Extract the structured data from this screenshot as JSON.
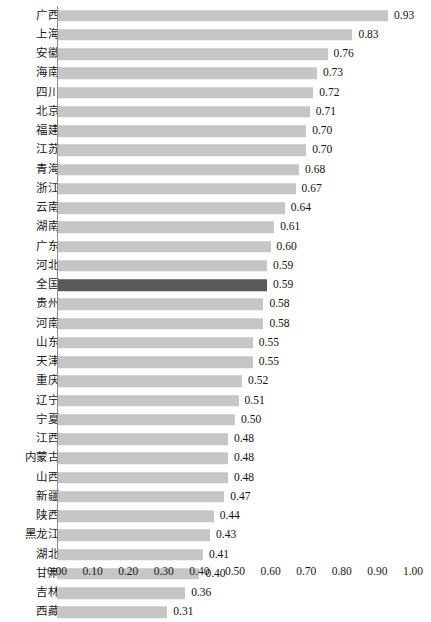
{
  "chart_data": {
    "type": "bar",
    "orientation": "horizontal",
    "title": "",
    "subtitle": "",
    "xlabel": "",
    "ylabel": "",
    "xlim": [
      0.0,
      1.0
    ],
    "xticks": [
      "0.00",
      "0.10",
      "0.20",
      "0.30",
      "0.40",
      "0.50",
      "0.60",
      "0.70",
      "0.80",
      "0.90",
      "1.00"
    ],
    "xtick_values": [
      0.0,
      0.1,
      0.2,
      0.3,
      0.4,
      0.5,
      0.6,
      0.7,
      0.8,
      0.9,
      1.0
    ],
    "grid": false,
    "legend": "none",
    "bar_color": "#c6c6c6",
    "highlight_color": "#595959",
    "axis_color": "#8a8a8a",
    "highlight_category": "全国",
    "categories": [
      "广西",
      "上海",
      "安徽",
      "海南",
      "四川",
      "北京",
      "福建",
      "江苏",
      "青海",
      "浙江",
      "云南",
      "湖南",
      "广东",
      "河北",
      "全国",
      "贵州",
      "河南",
      "山东",
      "天津",
      "重庆",
      "辽宁",
      "宁夏",
      "江西",
      "内蒙古",
      "山西",
      "新疆",
      "陕西",
      "黑龙江",
      "湖北",
      "甘肃",
      "吉林",
      "西藏"
    ],
    "values": [
      0.93,
      0.83,
      0.76,
      0.73,
      0.72,
      0.71,
      0.7,
      0.7,
      0.68,
      0.67,
      0.64,
      0.61,
      0.6,
      0.59,
      0.59,
      0.58,
      0.58,
      0.55,
      0.55,
      0.52,
      0.51,
      0.5,
      0.48,
      0.48,
      0.48,
      0.47,
      0.44,
      0.43,
      0.41,
      0.4,
      0.36,
      0.31
    ],
    "value_labels": [
      "0.93",
      "0.83",
      "0.76",
      "0.73",
      "0.72",
      "0.71",
      "0.70",
      "0.70",
      "0.68",
      "0.67",
      "0.64",
      "0.61",
      "0.60",
      "0.59",
      "0.59",
      "0.58",
      "0.58",
      "0.55",
      "0.55",
      "0.52",
      "0.51",
      "0.50",
      "0.48",
      "0.48",
      "0.48",
      "0.47",
      "0.44",
      "0.43",
      "0.41",
      "0.40",
      "0.36",
      "0.31"
    ]
  }
}
